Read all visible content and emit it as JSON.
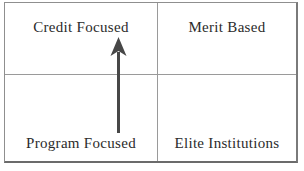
{
  "matrix": {
    "quadrants": {
      "top_left": {
        "label": "Credit Focused"
      },
      "top_right": {
        "label": "Merit Based"
      },
      "bottom_left": {
        "label": "Program Focused"
      },
      "bottom_right": {
        "label": "Elite Institutions"
      }
    },
    "arrow": {
      "direction": "up",
      "from_label": "Program Focused",
      "to_label": "Credit Focused",
      "color": "#474747"
    },
    "colors": {
      "background": "#ffffff",
      "border_outer": "#8f8f8f",
      "border_inner": "#9a9a9a",
      "text": "#2b2b2b"
    }
  }
}
